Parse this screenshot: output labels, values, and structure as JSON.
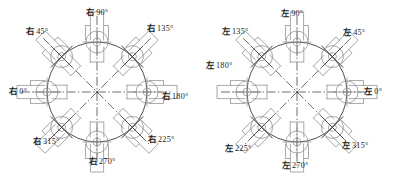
{
  "figure": {
    "panels": [
      {
        "id": "right-hand",
        "name": "右",
        "prefix": "右",
        "center": {
          "x": 97,
          "y": 92
        },
        "circle_radius": 50,
        "positions": [
          {
            "angle": 0,
            "label_cjk": "右",
            "label_deg": "0°",
            "label_x": 18,
            "label_y": 92
          },
          {
            "angle": 45,
            "label_cjk": "右",
            "label_deg": "45°",
            "label_x": 37,
            "label_y": 32
          },
          {
            "angle": 90,
            "label_cjk": "右",
            "label_deg": "90°",
            "label_x": 97,
            "label_y": 13
          },
          {
            "angle": 135,
            "label_cjk": "右",
            "label_deg": "135°",
            "label_x": 160,
            "label_y": 29
          },
          {
            "angle": 180,
            "label_cjk": "右",
            "label_deg": "180°",
            "label_x": 175,
            "label_y": 97
          },
          {
            "angle": 225,
            "label_cjk": "右",
            "label_deg": "225°",
            "label_x": 161,
            "label_y": 140
          },
          {
            "angle": 270,
            "label_cjk": "右",
            "label_deg": "270°",
            "label_x": 102,
            "label_y": 162
          },
          {
            "angle": 315,
            "label_cjk": "右",
            "label_deg": "315°",
            "label_x": 46,
            "label_y": 142
          }
        ]
      },
      {
        "id": "left-hand",
        "name": "左",
        "prefix": "左",
        "center": {
          "x": 100,
          "y": 92
        },
        "circle_radius": 50,
        "positions": [
          {
            "angle": 0,
            "label_cjk": "左",
            "label_deg": "0°",
            "label_x": 176,
            "label_y": 92
          },
          {
            "angle": 45,
            "label_cjk": "左",
            "label_deg": "45°",
            "label_x": 157,
            "label_y": 33
          },
          {
            "angle": 90,
            "label_cjk": "左",
            "label_deg": "90°",
            "label_x": 95,
            "label_y": 14
          },
          {
            "angle": 135,
            "label_cjk": "左",
            "label_deg": "135°",
            "label_x": 38,
            "label_y": 32
          },
          {
            "angle": 180,
            "label_cjk": "左",
            "label_deg": "180°",
            "label_x": 22,
            "label_y": 66
          },
          {
            "angle": 225,
            "label_cjk": "左",
            "label_deg": "225°",
            "label_x": 41,
            "label_y": 149
          },
          {
            "angle": 270,
            "label_cjk": "左",
            "label_deg": "270°",
            "label_x": 98,
            "label_y": 166
          },
          {
            "angle": 315,
            "label_cjk": "左",
            "label_deg": "315°",
            "label_x": 158,
            "label_y": 146
          }
        ]
      }
    ],
    "colors": {
      "line": "#3d3d3d",
      "housing": "#8c8c8c",
      "centerline": "#3d3d3d",
      "text": "#1c1c1c",
      "background": "#ffffff"
    },
    "geometry": {
      "unit_offset_radius": 50,
      "housing_width": 30,
      "housing_height": 22,
      "shaft_circle_outer": 11,
      "shaft_circle_inner": 4
    }
  }
}
